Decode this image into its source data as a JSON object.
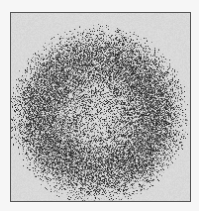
{
  "image": {
    "description": "Speckle pattern forming a circular disc with a darker annular ring and a lighter center",
    "frame": {
      "x": 10,
      "y": 12,
      "width": 181,
      "height": 190
    },
    "colors": {
      "page_background": "#f6f6f6",
      "frame_background": "#d9d9d9",
      "frame_border": "#555555",
      "speckle_dark": "#1e1e1e"
    },
    "disc": {
      "center_x": 88,
      "center_y": 103,
      "radius": 86,
      "ring_peak_radius": 55,
      "ring_width": 26,
      "center_density": 0.28,
      "ring_density": 0.72,
      "edge_density": 0.05
    },
    "speckle": {
      "pixel_size": 1,
      "seed": 1337
    }
  }
}
